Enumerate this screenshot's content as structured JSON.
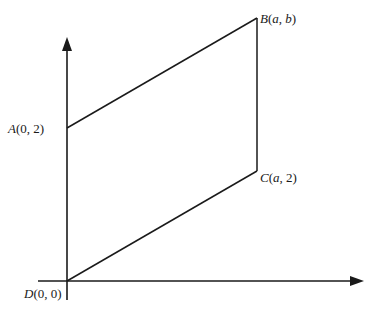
{
  "diagram": {
    "type": "parallelogram-on-axes",
    "points": {
      "A": {
        "name": "A",
        "coords": "(0, 2)",
        "label": "A(0, 2)"
      },
      "B": {
        "name": "B",
        "coords": "(a, b)",
        "label": "B(a, b)"
      },
      "C": {
        "name": "C",
        "coords": "(a, 2)",
        "label": "C(a, 2)"
      },
      "D": {
        "name": "D",
        "coords": "(0, 0)",
        "label": "D(0, 0)"
      }
    },
    "labels": {
      "A_letter": "A",
      "A_rest": "(0, 2)",
      "B_letter": "B",
      "B_open": "(",
      "B_a": "a",
      "B_comma": ", ",
      "B_b": "b",
      "B_close": ")",
      "C_letter": "C",
      "C_open": "(",
      "C_a": "a",
      "C_rest": ", 2)",
      "D_letter": "D",
      "D_rest": "(0, 0)"
    },
    "edges": [
      "AB",
      "BC",
      "CD",
      "DA"
    ],
    "colors": {
      "stroke": "#1a1a1a",
      "background": "#ffffff"
    }
  }
}
